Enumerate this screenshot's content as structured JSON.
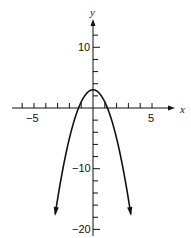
{
  "chart_data": {
    "type": "line",
    "title": "",
    "xlabel": "x",
    "ylabel": "y",
    "xlim": [
      -6,
      6
    ],
    "ylim": [
      -21,
      13
    ],
    "x_ticks_major_labels": [
      {
        "value": -5,
        "label": "-5"
      },
      {
        "value": 5,
        "label": "5"
      }
    ],
    "y_ticks_major_labels": [
      {
        "value": 10,
        "label": "10"
      },
      {
        "value": -10,
        "label": "-10"
      },
      {
        "value": -20,
        "label": "-20"
      }
    ],
    "x_tick_step": 1,
    "y_tick_step": 2,
    "grid": false,
    "series": [
      {
        "name": "parabola",
        "equation": "y = 3 - 2x^2",
        "x": [
          -3.2,
          -3,
          -2.5,
          -2,
          -1.5,
          -1,
          -0.5,
          0,
          0.5,
          1,
          1.5,
          2,
          2.5,
          3,
          3.2
        ],
        "values": [
          -17.48,
          -15,
          -9.5,
          -5,
          -1.5,
          1,
          2.5,
          3,
          2.5,
          1,
          -1.5,
          -5,
          -9.5,
          -15,
          -17.48
        ],
        "arrows_at_ends": true
      }
    ]
  },
  "labels": {
    "x_axis": "x",
    "y_axis": "y",
    "x_neg5": "−5",
    "x_pos5": "5",
    "y_10": "10",
    "y_neg10": "−10",
    "y_neg20": "−20"
  }
}
